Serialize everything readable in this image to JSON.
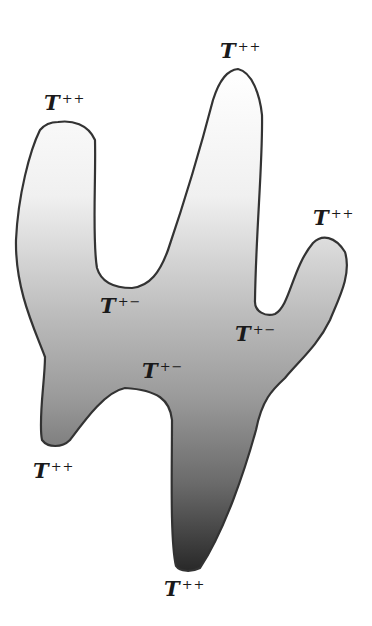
{
  "figure": {
    "shading": {
      "description": "vertical gradient, light at top, dark at bottom",
      "top_color": "#ffffff",
      "mid_color": "#a8a8a8",
      "bottom_color": "#2a2a2a",
      "outline_color": "#333333"
    },
    "labels": [
      {
        "id": "peak-top-left",
        "base": "T",
        "sup": "++",
        "x": 44,
        "y": 92
      },
      {
        "id": "peak-top-center",
        "base": "T",
        "sup": "++",
        "x": 220,
        "y": 40
      },
      {
        "id": "peak-right",
        "base": "T",
        "sup": "++",
        "x": 313,
        "y": 207
      },
      {
        "id": "saddle-left",
        "base": "T",
        "sup": "+−",
        "x": 100,
        "y": 295
      },
      {
        "id": "saddle-right",
        "base": "T",
        "sup": "+−",
        "x": 235,
        "y": 323
      },
      {
        "id": "saddle-center",
        "base": "T",
        "sup": "+−",
        "x": 142,
        "y": 360
      },
      {
        "id": "peak-bottom-left",
        "base": "T",
        "sup": "++",
        "x": 33,
        "y": 460
      },
      {
        "id": "peak-bottom",
        "base": "T",
        "sup": "++",
        "x": 164,
        "y": 578
      }
    ]
  }
}
